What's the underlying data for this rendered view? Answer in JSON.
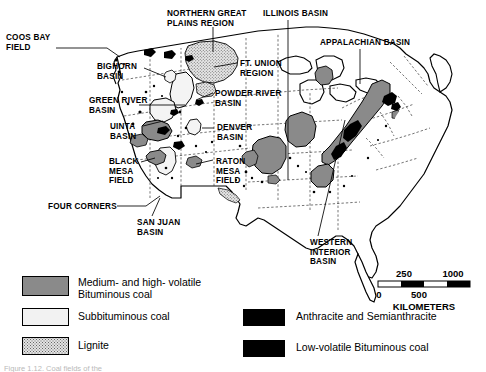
{
  "figure": {
    "caption_partial": "Figure 1.12. Coal fields of the"
  },
  "map_labels": [
    {
      "id": "coos-bay-field",
      "text": "COOS BAY\nFIELD",
      "x": 6,
      "y": 33
    },
    {
      "id": "bighorn-basin",
      "text": "BIGHORN\nBASIN",
      "x": 97,
      "y": 62
    },
    {
      "id": "green-river-basin",
      "text": "GREEN RIVER\nBASIN",
      "x": 89,
      "y": 96
    },
    {
      "id": "uinta-basin",
      "text": "UINTA\nBASIN",
      "x": 110,
      "y": 122
    },
    {
      "id": "black-mesa-field",
      "text": "BLACK\nMESA\nFIELD",
      "x": 109,
      "y": 157
    },
    {
      "id": "four-corners",
      "text": "FOUR CORNERS",
      "x": 48,
      "y": 202
    },
    {
      "id": "san-juan-basin",
      "text": "SAN JUAN\nBASIN",
      "x": 137,
      "y": 218
    },
    {
      "id": "northern-great-plains",
      "text": "NORTHERN GREAT\nPLAINS REGION",
      "x": 167,
      "y": 9
    },
    {
      "id": "ft-union-region",
      "text": "FT. UNION\nREGION",
      "x": 240,
      "y": 59
    },
    {
      "id": "powder-river-basin",
      "text": "POWDER RIVER\nBASIN",
      "x": 215,
      "y": 89
    },
    {
      "id": "denver-basin",
      "text": "DENVER\nBASIN",
      "x": 217,
      "y": 123
    },
    {
      "id": "raton-mesa-field",
      "text": "RATON\nMESA\nFIELD",
      "x": 216,
      "y": 157
    },
    {
      "id": "illinois-basin",
      "text": "ILLINOIS BASIN",
      "x": 263,
      "y": 9
    },
    {
      "id": "appalachian-basin",
      "text": "APPALACHIAN BASIN",
      "x": 320,
      "y": 38
    },
    {
      "id": "western-interior-basin",
      "text": "WESTERN\nINTERIOR\nBASIN",
      "x": 310,
      "y": 238
    }
  ],
  "leader_lines": [
    {
      "id": "coos-bay-leader",
      "points": "56,48 107,48 120,57"
    },
    {
      "id": "bighorn-leader",
      "points": "144,68 166,77"
    },
    {
      "id": "green-river-leader",
      "points": "139,105 185,105"
    },
    {
      "id": "uinta-leader",
      "points": "143,126 163,121"
    },
    {
      "id": "black-mesa-leader",
      "points": "141,162 155,158"
    },
    {
      "id": "four-corners-leader",
      "points": "117,206 146,206 160,196"
    },
    {
      "id": "san-juan-leader",
      "points": "152,216 160,198"
    },
    {
      "id": "ngp-leader",
      "points": "213,27 213,52"
    },
    {
      "id": "ft-union-leader",
      "points": "237,63 214,67"
    },
    {
      "id": "powder-river-leader",
      "points": "213,93 196,100"
    },
    {
      "id": "denver-leader",
      "points": "214,128 202,128"
    },
    {
      "id": "raton-leader",
      "points": "213,160 196,164"
    },
    {
      "id": "illinois-leader",
      "points": "288,20 288,180"
    },
    {
      "id": "appalachian-leader",
      "points": "360,49 360,84"
    },
    {
      "id": "western-interior-leader",
      "points": "318,236 345,120"
    }
  ],
  "legend": {
    "items": [
      {
        "id": "medium-high-volatile-bituminous",
        "label": "Medium- and high- volatile\nBituminous coal",
        "pattern": "bituminous-gray",
        "swatch": {
          "x": 22,
          "y": 276,
          "w": 47,
          "h": 20
        },
        "label_x": 78,
        "label_y": 276
      },
      {
        "id": "subbituminous",
        "label": "Subbituminous coal",
        "pattern": "subbituminous-white",
        "swatch": {
          "x": 22,
          "y": 308,
          "w": 47,
          "h": 18
        },
        "label_x": 78,
        "label_y": 310
      },
      {
        "id": "lignite",
        "label": "Lignite",
        "pattern": "lignite-stipple",
        "swatch": {
          "x": 22,
          "y": 337,
          "w": 47,
          "h": 18
        },
        "label_x": 78,
        "label_y": 339
      },
      {
        "id": "anthracite-semianthracite",
        "label": "Anthracite and Semianthracite",
        "pattern": "solid-black",
        "swatch": {
          "x": 243,
          "y": 309,
          "w": 42,
          "h": 17
        },
        "label_x": 296,
        "label_y": 310
      },
      {
        "id": "low-volatile-bituminous",
        "label": "Low-volatile Bituminous coal",
        "pattern": "solid-black",
        "swatch": {
          "x": 243,
          "y": 340,
          "w": 42,
          "h": 17
        },
        "label_x": 296,
        "label_y": 341
      }
    ]
  },
  "scale_bar": {
    "unit": "KILOMETERS",
    "ticks_top": [
      {
        "value": "250",
        "x": 404
      },
      {
        "value": "1000",
        "x": 453
      }
    ],
    "ticks_bottom": [
      {
        "value": "0",
        "x": 379
      },
      {
        "value": "500",
        "x": 419
      }
    ],
    "bar": {
      "x": 378,
      "y": 281,
      "w": 92,
      "h": 6
    },
    "segments": [
      {
        "from": 0,
        "to": 250,
        "fill": "white"
      },
      {
        "from": 250,
        "to": 500,
        "fill": "black"
      },
      {
        "from": 500,
        "to": 750,
        "fill": "white"
      },
      {
        "from": 750,
        "to": 1000,
        "fill": "black"
      }
    ],
    "max": 1000
  },
  "colors": {
    "bituminous_gray": "#8a8a8a",
    "subbituminous_white": "#f2f2f2",
    "lignite_stipple": "#e3e3e3",
    "anthracite_black": "#000000",
    "outline": "#000000",
    "state_border": "#555555",
    "background": "#ffffff"
  }
}
